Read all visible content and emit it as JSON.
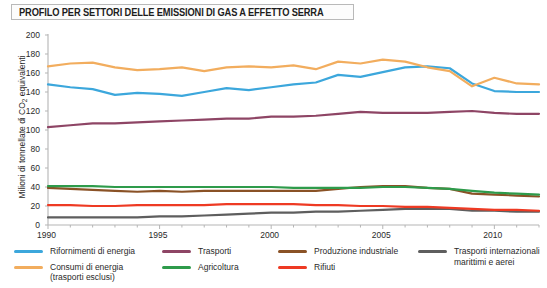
{
  "title": "PROFILO PER SETTORI DELLE EMISSIONI DI GAS A EFFETTO SERRA",
  "axes": {
    "y_title_main": "Milioni di tonnellate di CO",
    "y_title_sub": "2",
    "y_title_tail": " equivalenti",
    "y_ticks": [
      "200",
      "180",
      "160",
      "140",
      "120",
      "100",
      "80",
      "60",
      "40",
      "20",
      "0"
    ],
    "x_ticks": [
      "1990",
      "1995",
      "2000",
      "2005",
      "2010"
    ]
  },
  "legend": {
    "columns": [
      {
        "items": [
          {
            "label": "Rifornimenti di energia",
            "color": "#3CA7DC"
          },
          {
            "label": "Consumi di energia\n(trasporti esclusi)",
            "color": "#F2AD5E"
          }
        ]
      },
      {
        "items": [
          {
            "label": "Trasporti",
            "color": "#8E4565"
          },
          {
            "label": "Agricoltura",
            "color": "#2E9B4B"
          }
        ]
      },
      {
        "items": [
          {
            "label": "Produzione industriale",
            "color": "#8A5226"
          },
          {
            "label": "Rifiuti",
            "color": "#EE3A23"
          }
        ]
      },
      {
        "items": [
          {
            "label": "Trasporti internazionali\nmarittimi e aerei",
            "color": "#5E5E5E"
          }
        ]
      }
    ]
  },
  "chart_data": {
    "type": "line",
    "title": "PROFILO PER SETTORI DELLE EMISSIONI DI GAS A EFFETTO SERRA",
    "xlabel": "",
    "ylabel": "Milioni di tonnellate di CO2 equivalenti",
    "xlim": [
      1990,
      2012
    ],
    "ylim": [
      0,
      200
    ],
    "ytick_step": 20,
    "grid": false,
    "legend_position": "bottom",
    "x": [
      1990,
      1991,
      1992,
      1993,
      1994,
      1995,
      1996,
      1997,
      1998,
      1999,
      2000,
      2001,
      2002,
      2003,
      2004,
      2005,
      2006,
      2007,
      2008,
      2009,
      2010,
      2011,
      2012
    ],
    "series": [
      {
        "name": "Consumi di energia (trasporti esclusi)",
        "color": "#F2AD5E",
        "values": [
          167,
          170,
          171,
          166,
          163,
          164,
          166,
          162,
          166,
          167,
          166,
          168,
          164,
          172,
          170,
          174,
          172,
          166,
          162,
          146,
          155,
          149,
          148
        ]
      },
      {
        "name": "Rifornimenti di energia",
        "color": "#3CA7DC",
        "values": [
          148,
          145,
          143,
          137,
          139,
          138,
          136,
          140,
          144,
          142,
          145,
          148,
          150,
          158,
          156,
          161,
          166,
          167,
          165,
          149,
          141,
          140,
          140
        ]
      },
      {
        "name": "Trasporti",
        "color": "#8E4565",
        "values": [
          103,
          105,
          107,
          107,
          108,
          109,
          110,
          111,
          112,
          112,
          114,
          114,
          115,
          117,
          119,
          118,
          118,
          118,
          119,
          120,
          118,
          117,
          117
        ]
      },
      {
        "name": "Agricoltura",
        "color": "#2E9B4B",
        "values": [
          41,
          41,
          41,
          40,
          40,
          40,
          40,
          40,
          40,
          40,
          40,
          39,
          39,
          39,
          39,
          40,
          40,
          39,
          38,
          36,
          34,
          33,
          32
        ]
      },
      {
        "name": "Produzione industriale",
        "color": "#8A5226",
        "values": [
          39,
          38,
          37,
          36,
          35,
          36,
          35,
          36,
          36,
          36,
          36,
          36,
          36,
          38,
          40,
          41,
          41,
          39,
          38,
          33,
          32,
          31,
          30
        ]
      },
      {
        "name": "Rifiuti",
        "color": "#EE3A23",
        "values": [
          21,
          21,
          20,
          20,
          21,
          21,
          21,
          21,
          22,
          22,
          22,
          22,
          21,
          21,
          20,
          20,
          19,
          19,
          18,
          17,
          16,
          16,
          15
        ]
      },
      {
        "name": "Trasporti internazionali marittimi e aerei",
        "color": "#5E5E5E",
        "values": [
          8,
          8,
          8,
          8,
          8,
          9,
          9,
          10,
          11,
          12,
          13,
          13,
          14,
          14,
          15,
          16,
          17,
          17,
          17,
          15,
          15,
          14,
          14
        ]
      }
    ]
  }
}
